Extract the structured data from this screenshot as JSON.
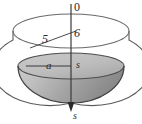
{
  "figure": {
    "caption": "",
    "labels": {
      "origin": "0",
      "slant_radius": "5",
      "upper_right": "6",
      "surface_radius": "a",
      "axis_mid": "s",
      "axis_bottom": "s"
    },
    "colors": {
      "outline": "#4a4a4a",
      "axis": "#3a3a3a",
      "liquid_surface": "#b9b9b9",
      "liquid_body_light": "#d6d6d6",
      "liquid_body_dark": "#8f8f8f",
      "background": "#ffffff"
    },
    "geometry": {
      "rim_center_x": 71,
      "rim_center_y": 31,
      "rim_radius_x": 58,
      "rim_radius_y": 17,
      "surface_center_x": 71,
      "surface_center_y": 66,
      "surface_radius_x": 53,
      "surface_radius_y": 13,
      "bowl_bottom_y": 103,
      "axis_top_y": 4,
      "axis_bottom_y": 110
    }
  }
}
